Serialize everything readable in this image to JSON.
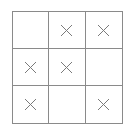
{
  "board": {
    "rows": 3,
    "cols": 3,
    "cells": [
      {
        "row": 0,
        "col": 0,
        "mark": ""
      },
      {
        "row": 0,
        "col": 1,
        "mark": "X"
      },
      {
        "row": 0,
        "col": 2,
        "mark": "X"
      },
      {
        "row": 1,
        "col": 0,
        "mark": "X"
      },
      {
        "row": 1,
        "col": 1,
        "mark": "X"
      },
      {
        "row": 1,
        "col": 2,
        "mark": ""
      },
      {
        "row": 2,
        "col": 0,
        "mark": "X"
      },
      {
        "row": 2,
        "col": 1,
        "mark": ""
      },
      {
        "row": 2,
        "col": 2,
        "mark": "X"
      }
    ],
    "line_color": "#8a8a8a",
    "mark_color": "#7a7a7a",
    "mark_icon": "x-mark-icon"
  }
}
